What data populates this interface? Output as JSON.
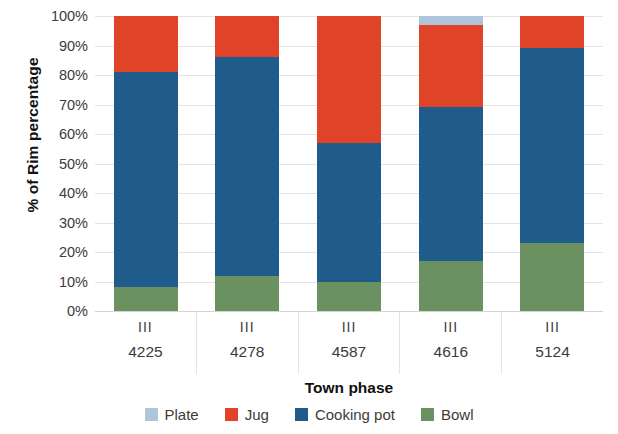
{
  "chart_data": {
    "type": "bar",
    "stacked": true,
    "title": "",
    "xlabel": "Town phase",
    "ylabel": "% of Rim percentage",
    "categories": [
      "4225",
      "4278",
      "4587",
      "4616",
      "5124"
    ],
    "category_groups": [
      "III",
      "III",
      "III",
      "III",
      "III"
    ],
    "ylim": [
      0,
      100
    ],
    "ytick_labels": [
      "100%",
      "90%",
      "80%",
      "70%",
      "60%",
      "50%",
      "40%",
      "30%",
      "20%",
      "10%",
      "0%"
    ],
    "ytick_values": [
      100,
      90,
      80,
      70,
      60,
      50,
      40,
      30,
      20,
      10,
      0
    ],
    "grid": true,
    "legend_position": "bottom",
    "series": [
      {
        "name": "Bowl",
        "color": "#6B9160",
        "values": [
          8,
          12,
          10,
          17,
          23
        ]
      },
      {
        "name": "Cooking pot",
        "color": "#1F5C8B",
        "values": [
          73,
          74,
          47,
          52,
          66
        ]
      },
      {
        "name": "Jug",
        "color": "#E04428",
        "values": [
          19,
          14,
          43,
          28,
          11
        ]
      },
      {
        "name": "Plate",
        "color": "#AEC5DC",
        "values": [
          0,
          0,
          0,
          3,
          0
        ]
      }
    ],
    "legend_entries": [
      {
        "label": "Plate",
        "color": "#AEC5DC"
      },
      {
        "label": "Jug",
        "color": "#E04428"
      },
      {
        "label": "Cooking pot",
        "color": "#1F5C8B"
      },
      {
        "label": "Bowl",
        "color": "#6B9160"
      }
    ]
  }
}
